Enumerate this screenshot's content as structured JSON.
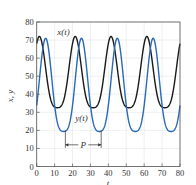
{
  "chart_data": {
    "type": "line",
    "title": "",
    "xlabel": "t",
    "ylabel": "x, y",
    "xlim": [
      0,
      80
    ],
    "ylim": [
      0,
      80
    ],
    "xticks": [
      "0",
      "10",
      "20",
      "30",
      "40",
      "50",
      "60",
      "70",
      "80"
    ],
    "yticks": [
      "0",
      "10",
      "20",
      "30",
      "40",
      "50",
      "60",
      "70",
      "80"
    ],
    "grid": true,
    "period": 20,
    "series": [
      {
        "name": "x(t)",
        "color": "#1a1a1a",
        "mean": 52,
        "amplitude": 19.5,
        "peak_t": 1.5,
        "peak": 72,
        "trough": 33
      },
      {
        "name": "y(t)",
        "color": "#2a6ab8",
        "mean": 45.5,
        "amplitude": 25.5,
        "peak_t": 5,
        "peak": 71,
        "trough": 20
      }
    ],
    "annotations": [
      {
        "text": "x(t)",
        "t": 15,
        "y": 73
      },
      {
        "text": "y(t)",
        "t": 25,
        "y": 25
      },
      {
        "text": "P",
        "from_t": 16,
        "to_t": 36,
        "y": 12
      }
    ]
  }
}
